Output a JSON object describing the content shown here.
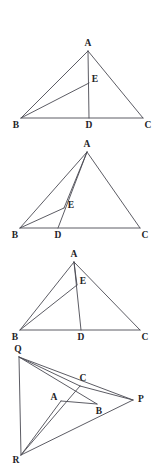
{
  "page": {
    "background_color": "#ffffff",
    "line_color": "#4a4a52",
    "label_color": "#232327",
    "width": 157,
    "height": 464
  },
  "figures": [
    {
      "id": "figure-1",
      "name": "triangle-abc-with-cevian-ad-and-point-e",
      "shape": "triangle",
      "points": {
        "A": {
          "label": "A",
          "x": 88,
          "y": 51
        },
        "B": {
          "label": "B",
          "x": 21,
          "y": 118
        },
        "C": {
          "label": "C",
          "x": 143,
          "y": 118
        },
        "D": {
          "label": "D",
          "x": 89,
          "y": 118
        },
        "E": {
          "label": "E",
          "x": 89,
          "y": 83
        }
      },
      "label_offsets": {
        "A": {
          "dx": 0,
          "dy": -7
        },
        "B": {
          "dx": -5,
          "dy": 8
        },
        "C": {
          "dx": 5,
          "dy": 8
        },
        "D": {
          "dx": 0,
          "dy": 8
        },
        "E": {
          "dx": 6,
          "dy": -3
        }
      },
      "segments": [
        {
          "name": "side-ab",
          "from": "A",
          "to": "B"
        },
        {
          "name": "side-ac",
          "from": "A",
          "to": "C"
        },
        {
          "name": "side-bc",
          "from": "B",
          "to": "C"
        },
        {
          "name": "cevian-ad",
          "from": "A",
          "to": "D"
        },
        {
          "name": "segment-be",
          "from": "B",
          "to": "E"
        }
      ]
    },
    {
      "id": "figure-2",
      "name": "triangle-abc-with-cevian-ad-left-and-point-e",
      "shape": "triangle",
      "points": {
        "A": {
          "label": "A",
          "x": 87,
          "y": 152
        },
        "B": {
          "label": "B",
          "x": 20,
          "y": 228
        },
        "C": {
          "label": "C",
          "x": 140,
          "y": 228
        },
        "D": {
          "label": "D",
          "x": 58,
          "y": 228
        },
        "E": {
          "label": "E",
          "x": 64,
          "y": 208
        }
      },
      "label_offsets": {
        "A": {
          "dx": 0,
          "dy": -7
        },
        "B": {
          "dx": -5,
          "dy": 8
        },
        "C": {
          "dx": 5,
          "dy": 8
        },
        "D": {
          "dx": 0,
          "dy": 8
        },
        "E": {
          "dx": 7,
          "dy": -2
        }
      },
      "segments": [
        {
          "name": "side-ab",
          "from": "A",
          "to": "B"
        },
        {
          "name": "side-ac",
          "from": "A",
          "to": "C"
        },
        {
          "name": "side-bc",
          "from": "B",
          "to": "C"
        },
        {
          "name": "cevian-ad",
          "from": "A",
          "to": "D"
        },
        {
          "name": "segment-be",
          "from": "B",
          "to": "E"
        },
        {
          "name": "segment-ae",
          "from": "A",
          "to": "E"
        }
      ]
    },
    {
      "id": "figure-3",
      "name": "triangle-abc-with-cevian-ad-and-point-e-high",
      "shape": "triangle",
      "points": {
        "A": {
          "label": "A",
          "x": 74,
          "y": 262
        },
        "B": {
          "label": "B",
          "x": 20,
          "y": 330
        },
        "C": {
          "label": "C",
          "x": 140,
          "y": 330
        },
        "D": {
          "label": "D",
          "x": 81,
          "y": 330
        },
        "E": {
          "label": "E",
          "x": 77,
          "y": 285
        }
      },
      "label_offsets": {
        "A": {
          "dx": 0,
          "dy": -7
        },
        "B": {
          "dx": -5,
          "dy": 8
        },
        "C": {
          "dx": 5,
          "dy": 8
        },
        "D": {
          "dx": 0,
          "dy": 8
        },
        "E": {
          "dx": 6,
          "dy": -3
        }
      },
      "segments": [
        {
          "name": "side-ab",
          "from": "A",
          "to": "B"
        },
        {
          "name": "side-ac",
          "from": "A",
          "to": "C"
        },
        {
          "name": "side-bc",
          "from": "B",
          "to": "C"
        },
        {
          "name": "cevian-ad",
          "from": "A",
          "to": "D"
        },
        {
          "name": "segment-be",
          "from": "B",
          "to": "E"
        },
        {
          "name": "segment-ae",
          "from": "A",
          "to": "E"
        }
      ]
    },
    {
      "id": "figure-4",
      "name": "triangle-pqr-with-inner-triangle-abc",
      "shape": "triangle",
      "points": {
        "Q": {
          "label": "Q",
          "x": 19,
          "y": 357
        },
        "R": {
          "label": "R",
          "x": 21,
          "y": 455
        },
        "P": {
          "label": "P",
          "x": 133,
          "y": 400
        },
        "A": {
          "label": "A",
          "x": 61,
          "y": 401
        },
        "B": {
          "label": "B",
          "x": 97,
          "y": 404
        },
        "C": {
          "label": "C",
          "x": 80,
          "y": 386
        }
      },
      "label_offsets": {
        "Q": {
          "dx": -1,
          "dy": -7
        },
        "R": {
          "dx": -5,
          "dy": 6
        },
        "P": {
          "dx": 8,
          "dy": 0
        },
        "A": {
          "dx": -7,
          "dy": -3
        },
        "B": {
          "dx": 2,
          "dy": 8
        },
        "C": {
          "dx": 3,
          "dy": -7
        }
      },
      "segments": [
        {
          "name": "side-qr",
          "from": "Q",
          "to": "R"
        },
        {
          "name": "side-rp",
          "from": "R",
          "to": "P"
        },
        {
          "name": "side-pq",
          "from": "P",
          "to": "Q"
        },
        {
          "name": "cevian-qb",
          "from": "Q",
          "to": "B"
        },
        {
          "name": "cevian-ra",
          "from": "R",
          "to": "A"
        },
        {
          "name": "segment-ab",
          "from": "A",
          "to": "B"
        },
        {
          "name": "segment-cp",
          "from": "C",
          "to": "P"
        },
        {
          "name": "segment-qc-extended",
          "from": "Q",
          "to": "C"
        },
        {
          "name": "segment-rc-extended",
          "from": "R",
          "to": "C"
        }
      ]
    }
  ]
}
